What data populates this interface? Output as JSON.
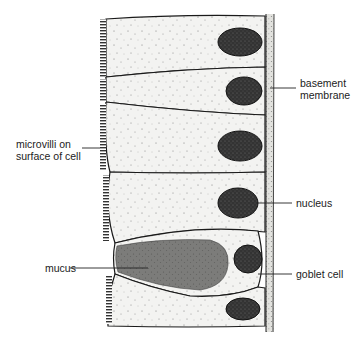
{
  "diagram": {
    "colors": {
      "cytoplasm": "#f2f2f0",
      "outline": "#1a1a1a",
      "nucleus": "#3a3a3a",
      "mucus": "#7a7a78",
      "membrane": "#d8d8d4",
      "label_text": "#222222"
    },
    "labels": {
      "microvilli": [
        "microvilli on",
        "surface of cell"
      ],
      "basement_membrane": [
        "basement",
        "membrane"
      ],
      "nucleus": "nucleus",
      "mucus": "mucus",
      "goblet_cell": "goblet cell"
    }
  }
}
